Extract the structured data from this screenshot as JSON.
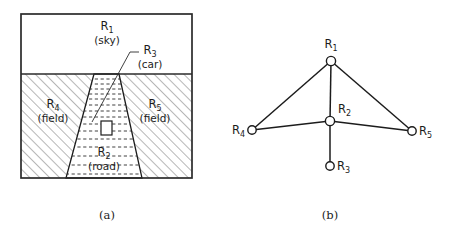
{
  "figure": {
    "panels": [
      {
        "id": "panel-a",
        "caption": "(a)",
        "type": "scene-sketch",
        "frame": {
          "x": 21,
          "y": 14,
          "width": 171,
          "height": 164
        },
        "horizon_y": 74,
        "regions": [
          {
            "key": "R1",
            "label": "R",
            "subscript": "1",
            "name": "(sky)",
            "label_x": 107,
            "label_y": 30,
            "name_x": 107,
            "name_y": 44
          },
          {
            "key": "R3",
            "label": "R",
            "subscript": "3",
            "name": "(car)",
            "label_x": 150,
            "label_y": 54,
            "name_x": 150,
            "name_y": 68
          },
          {
            "key": "R4",
            "label": "R",
            "subscript": "4",
            "name": "(field)",
            "label_x": 53,
            "label_y": 108,
            "name_x": 53,
            "name_y": 122
          },
          {
            "key": "R5",
            "label": "R",
            "subscript": "5",
            "name": "(field)",
            "label_x": 155,
            "label_y": 108,
            "name_x": 155,
            "name_y": 122
          },
          {
            "key": "R2",
            "label": "R",
            "subscript": "2",
            "name": "(road)",
            "label_x": 104,
            "label_y": 156,
            "name_x": 104,
            "name_y": 170
          }
        ],
        "road_polygon": "94,74 119,74 142,178 66,178",
        "car_rect": {
          "x": 101,
          "y": 121,
          "width": 11,
          "height": 14
        },
        "leader": "139,52 129,52 88,126"
      },
      {
        "id": "panel-b",
        "caption": "(b)",
        "type": "region-adjacency-graph",
        "nodes": [
          {
            "key": "R1",
            "label": "R",
            "subscript": "1",
            "cx": 331,
            "cy": 61,
            "r": 4.6,
            "label_x": 331,
            "label_y": 46,
            "label_anchor": "middle"
          },
          {
            "key": "R2",
            "label": "R",
            "subscript": "2",
            "cx": 330,
            "cy": 121,
            "r": 4.6,
            "label_x": 339,
            "label_y": 112,
            "label_anchor": "start"
          },
          {
            "key": "R3",
            "label": "R",
            "subscript": "3",
            "cx": 330,
            "cy": 166,
            "r": 4.2,
            "label_x": 338,
            "label_y": 170,
            "label_anchor": "start"
          },
          {
            "key": "R4",
            "label": "R",
            "subscript": "4",
            "cx": 252,
            "cy": 130,
            "r": 4.2,
            "label_x": 244,
            "label_y": 134,
            "label_anchor": "end"
          },
          {
            "key": "R5",
            "label": "R",
            "subscript": "5",
            "cx": 412,
            "cy": 131,
            "r": 4.2,
            "label_x": 420,
            "label_y": 135,
            "label_anchor": "start"
          }
        ],
        "edges": [
          {
            "from": "R1",
            "to": "R4"
          },
          {
            "from": "R1",
            "to": "R2"
          },
          {
            "from": "R1",
            "to": "R5"
          },
          {
            "from": "R4",
            "to": "R2"
          },
          {
            "from": "R2",
            "to": "R5"
          },
          {
            "from": "R2",
            "to": "R3"
          }
        ]
      }
    ],
    "captions": [
      {
        "key": "caption-a",
        "text": "(a)",
        "x": 107,
        "y": 219
      },
      {
        "key": "caption-b",
        "text": "(b)",
        "x": 330,
        "y": 219
      }
    ],
    "colors": {
      "ink": "#1c1c1c",
      "frame": "#2b2b2b",
      "hatch": "#555555",
      "paper": "#ffffff"
    }
  }
}
